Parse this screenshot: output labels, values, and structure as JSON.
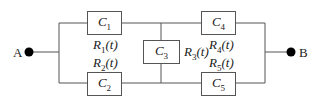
{
  "diagram": {
    "type": "reliability-block-diagram",
    "nodes": {
      "start": {
        "label": "A"
      },
      "end": {
        "label": "B"
      }
    },
    "components": [
      {
        "id": "C1",
        "label": "C1",
        "reliability": "R1(t)"
      },
      {
        "id": "C2",
        "label": "C2",
        "reliability": "R2(t)"
      },
      {
        "id": "C3",
        "label": "C3",
        "reliability": "R3(t)"
      },
      {
        "id": "C4",
        "label": "C4",
        "reliability": "R4(t)"
      },
      {
        "id": "C5",
        "label": "C5",
        "reliability": "R5(t)"
      }
    ],
    "connections": [
      [
        "A",
        "C1"
      ],
      [
        "A",
        "C2"
      ],
      [
        "C1",
        "C4"
      ],
      [
        "C2",
        "C5"
      ],
      [
        "C1",
        "C3"
      ],
      [
        "C3",
        "C2"
      ],
      [
        "C4",
        "B"
      ],
      [
        "C5",
        "B"
      ]
    ],
    "colors": {
      "line": "#555555",
      "text": "#222222",
      "background": "#ffffff"
    }
  }
}
